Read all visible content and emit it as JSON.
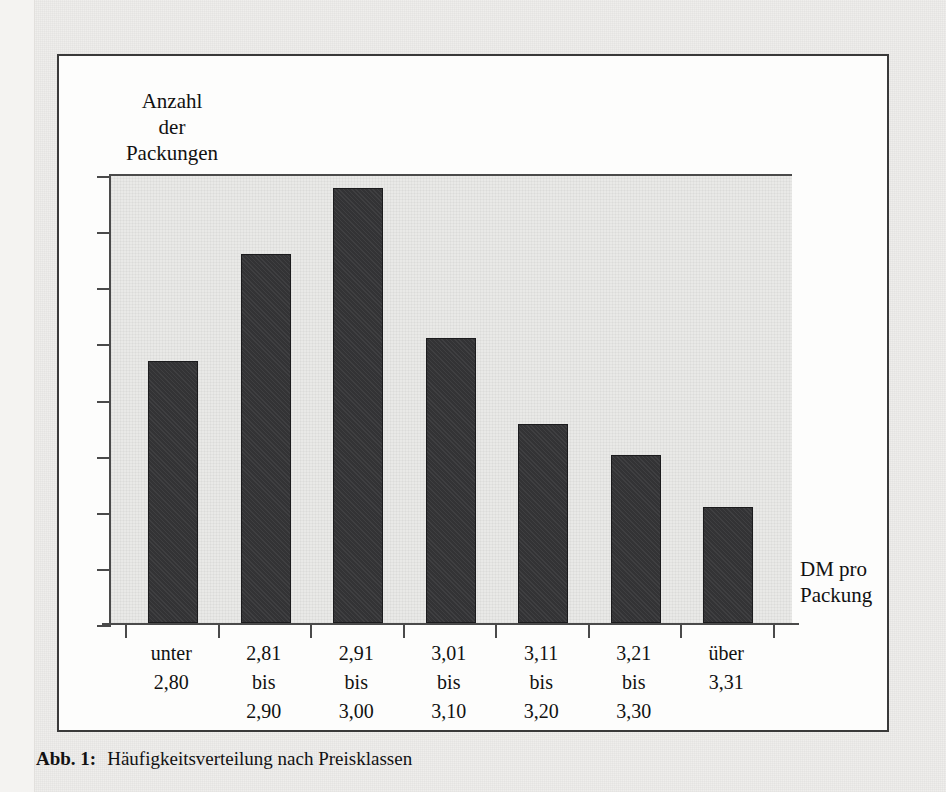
{
  "figure": {
    "caption_label": "Abb. 1:",
    "caption_text": "Häufigkeitsverteilung nach Preisklassen"
  },
  "chart_data": {
    "type": "bar",
    "title": "",
    "ylabel": "Anzahl der Packungen",
    "ylabel_lines": [
      "Anzahl",
      "der",
      "Packungen"
    ],
    "xlabel": "DM pro Packung",
    "xlabel_lines": [
      "DM pro",
      "Packung"
    ],
    "categories": [
      "unter 2,80",
      "2,81 bis 2,90",
      "2,91 bis 3,00",
      "3,01 bis 3,10",
      "3,11 bis 3,20",
      "3,21 bis 3,30",
      "über 3,31"
    ],
    "category_lines": [
      [
        "unter",
        "2,80",
        ""
      ],
      [
        "2,81",
        "bis",
        "2,90"
      ],
      [
        "2,91",
        "bis",
        "3,00"
      ],
      [
        "3,01",
        "bis",
        "3,10"
      ],
      [
        "3,11",
        "bis",
        "3,20"
      ],
      [
        "3,21",
        "bis",
        "3,30"
      ],
      [
        "über",
        "3,31",
        ""
      ]
    ],
    "values": [
      4.66,
      6.58,
      7.75,
      5.08,
      3.55,
      3.0,
      2.06
    ],
    "ylim": [
      0,
      8
    ],
    "y_tick_count": 9,
    "y_tick_labels": [],
    "grid": false,
    "legend": false,
    "bar_color": "#333335",
    "plot_background": "#e9e9e7",
    "axis_color": "#4a4a4a"
  }
}
